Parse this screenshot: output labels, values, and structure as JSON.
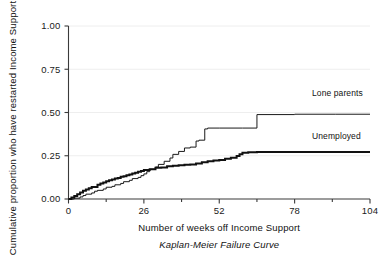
{
  "chart_data": {
    "type": "line",
    "title": "",
    "subtitle": "Kaplan-Meier Failure Curve",
    "xlabel": "Number of weeks off Income Support",
    "ylabel": "Cumulative proportion who have restarted Income Support",
    "xlim": [
      0,
      104
    ],
    "ylim": [
      0.0,
      1.0
    ],
    "xticks": [
      0,
      26,
      52,
      78,
      104
    ],
    "xticklabels": [
      "0",
      "26",
      "52",
      "78",
      "104"
    ],
    "yticks": [
      0.0,
      0.25,
      0.5,
      0.75,
      1.0
    ],
    "yticklabels": [
      "0.00",
      "0.25",
      "0.50",
      "0.75",
      "1.00"
    ],
    "grid": "horizontal-faint",
    "legend_position": "inline-right",
    "step_type": "post",
    "series": [
      {
        "name": "Lone parents",
        "style": "thin",
        "color": "#1a1a1a",
        "label_x": 84,
        "label_y": 0.595,
        "x": [
          0,
          2,
          4,
          5,
          6,
          8,
          9,
          10,
          12,
          13,
          15,
          16,
          18,
          19,
          21,
          22,
          24,
          25,
          26,
          27,
          28,
          30,
          31,
          33,
          35,
          36,
          38,
          40,
          42,
          44,
          45,
          47,
          48,
          52,
          60,
          64,
          65,
          78,
          92,
          104
        ],
        "y": [
          0.0,
          0.005,
          0.012,
          0.02,
          0.028,
          0.035,
          0.045,
          0.05,
          0.058,
          0.068,
          0.073,
          0.082,
          0.09,
          0.1,
          0.108,
          0.118,
          0.125,
          0.135,
          0.145,
          0.158,
          0.172,
          0.185,
          0.2,
          0.218,
          0.237,
          0.258,
          0.275,
          0.295,
          0.3,
          0.335,
          0.34,
          0.405,
          0.41,
          0.41,
          0.41,
          0.41,
          0.488,
          0.49,
          0.49,
          0.49
        ]
      },
      {
        "name": "Unemployed",
        "style": "thick",
        "color": "#111111",
        "label_x": 84,
        "label_y": 0.345,
        "x": [
          0,
          1,
          2,
          3,
          4,
          5,
          6,
          7,
          8,
          10,
          11,
          12,
          13,
          14,
          15,
          16,
          17,
          18,
          19,
          20,
          21,
          22,
          23,
          24,
          25,
          26,
          28,
          30,
          32,
          34,
          36,
          38,
          40,
          42,
          44,
          46,
          48,
          50,
          52,
          54,
          56,
          58,
          59,
          60,
          62,
          65,
          78,
          92,
          104
        ],
        "y": [
          0.0,
          0.008,
          0.018,
          0.028,
          0.038,
          0.048,
          0.055,
          0.062,
          0.07,
          0.082,
          0.09,
          0.095,
          0.102,
          0.108,
          0.112,
          0.118,
          0.122,
          0.128,
          0.132,
          0.138,
          0.142,
          0.148,
          0.152,
          0.158,
          0.162,
          0.168,
          0.172,
          0.18,
          0.182,
          0.19,
          0.192,
          0.195,
          0.198,
          0.2,
          0.205,
          0.212,
          0.218,
          0.222,
          0.225,
          0.232,
          0.238,
          0.248,
          0.258,
          0.268,
          0.27,
          0.272,
          0.272,
          0.272,
          0.272
        ]
      }
    ]
  }
}
